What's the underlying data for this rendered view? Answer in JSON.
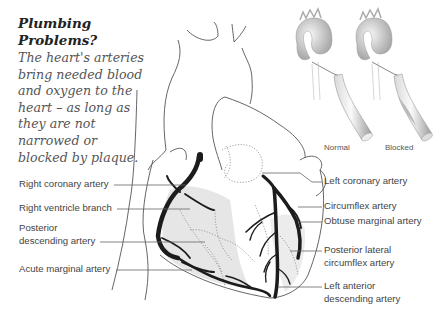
{
  "intro": {
    "title": "Plumbing Problems?",
    "body": "The heart's arteries bring needed blood and oxygen to the heart – as long as they are not narrowed or blocked by plaque."
  },
  "inset": {
    "captions": [
      "Normal",
      "Blocked"
    ]
  },
  "labels_left": [
    {
      "text": "Right coronary artery"
    },
    {
      "text": "Right ventricle branch"
    },
    {
      "line1": "Posterior",
      "line2": "descending artery"
    },
    {
      "text": "Acute marginal artery"
    }
  ],
  "labels_right": [
    {
      "text": "Left coronary artery"
    },
    {
      "text": "Circumflex artery"
    },
    {
      "text": "Obtuse marginal artery"
    },
    {
      "line1": "Posterior lateral",
      "line2": "circumflex artery"
    },
    {
      "line1": "Left anterior",
      "line2": "descending artery"
    }
  ],
  "colors": {
    "artery": "#1c1c1c",
    "outline": "#555555",
    "shade": "#e6e6e6",
    "label_text": "#444444"
  }
}
